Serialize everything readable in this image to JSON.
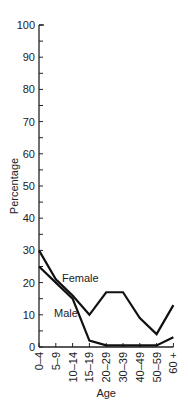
{
  "chart_data": {
    "type": "line",
    "title": "",
    "xlabel": "Age",
    "ylabel": "Percentage",
    "ylim": [
      0,
      100
    ],
    "yticks": [
      0,
      10,
      20,
      30,
      40,
      50,
      60,
      70,
      80,
      90,
      100
    ],
    "categories": [
      "0–4",
      "5–9",
      "10–14",
      "15–19",
      "20–29",
      "30–39",
      "40–49",
      "50–59",
      "60 +"
    ],
    "series": [
      {
        "name": "Female",
        "values": [
          30,
          21,
          16,
          10,
          17,
          17,
          9,
          4,
          13
        ]
      },
      {
        "name": "Male",
        "values": [
          25,
          20,
          15,
          2,
          0.5,
          0.5,
          0.5,
          0.5,
          3
        ]
      }
    ],
    "grid": false,
    "legend": "inline labels"
  }
}
